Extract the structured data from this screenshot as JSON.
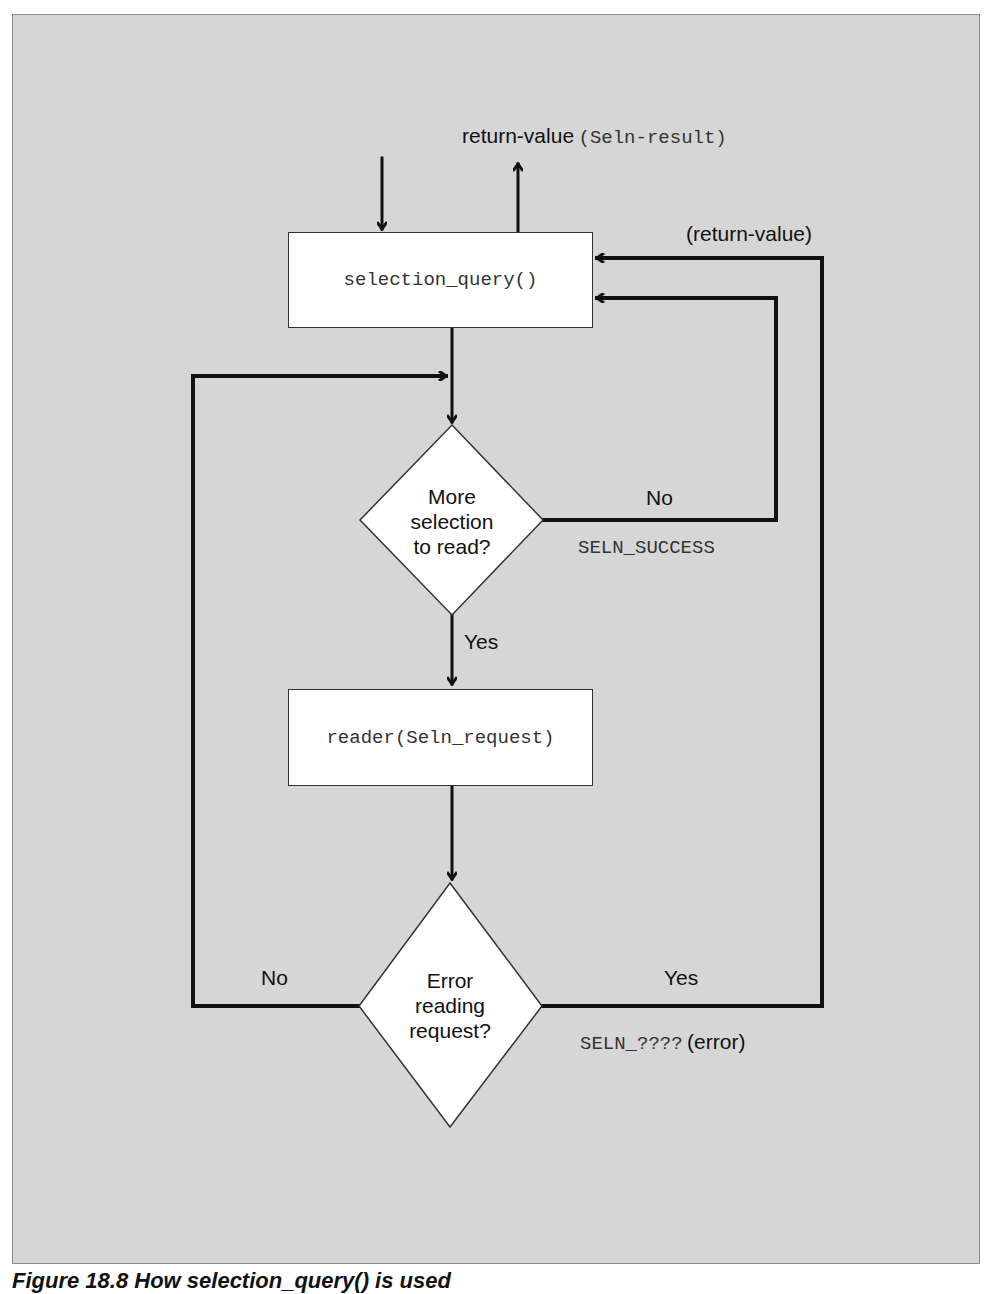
{
  "figure": {
    "caption": "Figure 18.8  How selection_query() is used",
    "background_color": "#d6d6d6"
  },
  "nodes": {
    "selection_query_box": {
      "label": "selection_query()"
    },
    "more_selection_decision": {
      "lines": [
        "More",
        "selection",
        "to read?"
      ]
    },
    "reader_box": {
      "label": "reader(Seln_request)"
    },
    "error_decision": {
      "lines": [
        "Error",
        "reading",
        "request?"
      ]
    }
  },
  "edges": {
    "return_value_top": {
      "label": "return-value",
      "code": "(Seln-result)"
    },
    "return_value_loop": {
      "label": "(return-value)"
    },
    "more_no": {
      "label": "No",
      "code": "SELN_SUCCESS"
    },
    "more_yes": {
      "label": "Yes"
    },
    "error_no": {
      "label": "No"
    },
    "error_yes": {
      "label": "Yes",
      "code": "SELN_????",
      "suffix": "(error)"
    }
  }
}
